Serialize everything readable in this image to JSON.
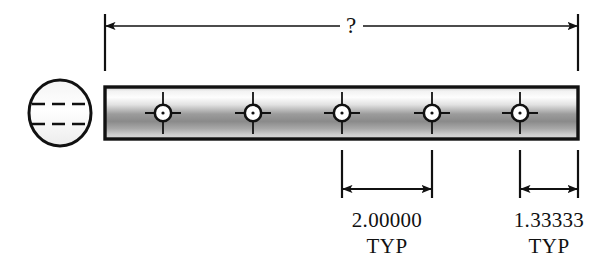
{
  "drawing": {
    "title": "Hole-pattern bar detail drawing",
    "units_note": "",
    "colors": {
      "line": "#111111",
      "background": "#ffffff",
      "bar_highlight": "#ffffff",
      "bar_midtone": "#8e8e8e",
      "bar_shadow": "#b9b9b9",
      "hole_fill": "#ffffff"
    },
    "overall_dimension": {
      "label": "?",
      "name": "overall-length-unknown",
      "arrowheads": "both",
      "x_start": 105,
      "x_end": 578,
      "y": 26
    },
    "end_view": {
      "name": "circular-end-view",
      "shape": "circle",
      "hidden_lines": 2,
      "center_x": 60,
      "center_y": 113,
      "radius_x": 31,
      "radius_y": 33
    },
    "bar": {
      "name": "bar-side-view",
      "x": 105,
      "y": 87,
      "width": 473,
      "height": 52
    },
    "holes": [
      {
        "id": 1,
        "label": "hole-1",
        "cx": 163,
        "cy": 113
      },
      {
        "id": 2,
        "label": "hole-2",
        "cx": 253,
        "cy": 113
      },
      {
        "id": 3,
        "label": "hole-3",
        "cx": 342,
        "cy": 113
      },
      {
        "id": 4,
        "label": "hole-4",
        "cx": 432,
        "cy": 113
      },
      {
        "id": 5,
        "label": "hole-5",
        "cx": 520,
        "cy": 113
      }
    ],
    "dimensions": [
      {
        "name": "spacing-dimension-left",
        "value": "2.00000",
        "note": "TYP",
        "x_start": 342,
        "x_end": 432,
        "dim_line_y": 189,
        "text_x": 387,
        "text_y": 224,
        "note_y": 250
      },
      {
        "name": "spacing-dimension-right",
        "value": "1.33333",
        "note": "TYP",
        "x_start": 520,
        "x_end": 578,
        "dim_line_y": 189,
        "text_x": 549,
        "text_y": 224,
        "note_y": 250
      }
    ]
  }
}
